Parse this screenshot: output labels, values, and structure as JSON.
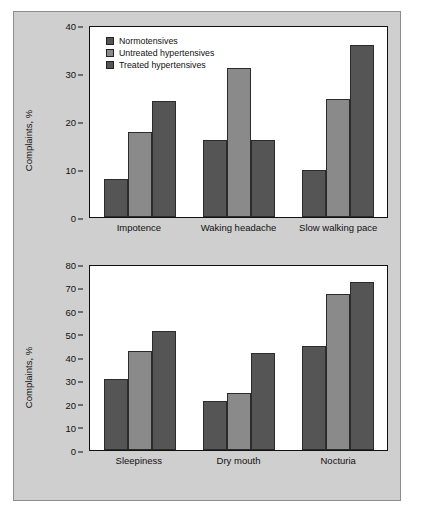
{
  "figure": {
    "background_color": "#cfcfcf",
    "plot_background_color": "#ffffff",
    "border_color": "#8d8d8d"
  },
  "legend": {
    "position": "top-left-inside-upper-panel",
    "items": [
      {
        "label": "Normotensives",
        "color": "#555555"
      },
      {
        "label": "Untreated hypertensives",
        "color": "#8a8a8a"
      },
      {
        "label": "Treated hypertensives",
        "color": "#555555"
      }
    ]
  },
  "chart_data": [
    {
      "id": "upper",
      "type": "bar",
      "title": "",
      "xlabel": "",
      "ylabel": "Complaints, %",
      "ylim": [
        0,
        40
      ],
      "yticks": [
        0,
        10,
        20,
        30,
        40
      ],
      "grid": false,
      "legend_position": "upper left",
      "categories": [
        "Impotence",
        "Waking headache",
        "Slow walking pace"
      ],
      "series": [
        {
          "name": "Normotensives",
          "color": "#555555",
          "values": [
            8.0,
            16.2,
            10.0
          ]
        },
        {
          "name": "Untreated hypertensives",
          "color": "#8a8a8a",
          "values": [
            18.0,
            31.5,
            25.0
          ]
        },
        {
          "name": "Treated hypertensives",
          "color": "#555555",
          "values": [
            24.5,
            16.2,
            36.5
          ]
        }
      ]
    },
    {
      "id": "lower",
      "type": "bar",
      "title": "",
      "xlabel": "",
      "ylabel": "Complaints, %",
      "ylim": [
        0,
        80
      ],
      "yticks": [
        0,
        10,
        20,
        30,
        40,
        50,
        60,
        70,
        80
      ],
      "grid": false,
      "legend_position": "none",
      "categories": [
        "Sleepiness",
        "Dry mouth",
        "Nocturia"
      ],
      "series": [
        {
          "name": "Normotensives",
          "color": "#555555",
          "values": [
            31.0,
            21.5,
            45.5
          ]
        },
        {
          "name": "Untreated hypertensives",
          "color": "#8a8a8a",
          "values": [
            43.5,
            25.0,
            68.0
          ]
        },
        {
          "name": "Treated hypertensives",
          "color": "#555555",
          "values": [
            52.0,
            42.5,
            73.5
          ]
        }
      ]
    }
  ]
}
